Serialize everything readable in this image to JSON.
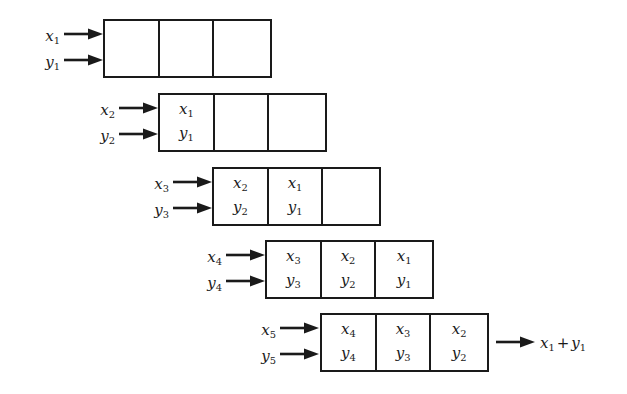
{
  "diagram": {
    "stroke_color": "#1a1a1a",
    "background_color": "#ffffff",
    "stages": [
      {
        "id": "stage-1",
        "inputs": [
          {
            "label": "x",
            "index": "1"
          },
          {
            "label": "y",
            "index": "1"
          }
        ],
        "cells": [
          {
            "top": "",
            "top_index": "",
            "bottom": "",
            "bottom_index": ""
          },
          {
            "top": "",
            "top_index": "",
            "bottom": "",
            "bottom_index": ""
          },
          {
            "top": "",
            "top_index": "",
            "bottom": "",
            "bottom_index": ""
          }
        ],
        "output": null
      },
      {
        "id": "stage-2",
        "inputs": [
          {
            "label": "x",
            "index": "2"
          },
          {
            "label": "y",
            "index": "2"
          }
        ],
        "cells": [
          {
            "top": "x",
            "top_index": "1",
            "bottom": "y",
            "bottom_index": "1"
          },
          {
            "top": "",
            "top_index": "",
            "bottom": "",
            "bottom_index": ""
          },
          {
            "top": "",
            "top_index": "",
            "bottom": "",
            "bottom_index": ""
          }
        ],
        "output": null
      },
      {
        "id": "stage-3",
        "inputs": [
          {
            "label": "x",
            "index": "3"
          },
          {
            "label": "y",
            "index": "3"
          }
        ],
        "cells": [
          {
            "top": "x",
            "top_index": "2",
            "bottom": "y",
            "bottom_index": "2"
          },
          {
            "top": "x",
            "top_index": "1",
            "bottom": "y",
            "bottom_index": "1"
          },
          {
            "top": "",
            "top_index": "",
            "bottom": "",
            "bottom_index": ""
          }
        ],
        "output": null
      },
      {
        "id": "stage-4",
        "inputs": [
          {
            "label": "x",
            "index": "4"
          },
          {
            "label": "y",
            "index": "4"
          }
        ],
        "cells": [
          {
            "top": "x",
            "top_index": "3",
            "bottom": "y",
            "bottom_index": "3"
          },
          {
            "top": "x",
            "top_index": "2",
            "bottom": "y",
            "bottom_index": "2"
          },
          {
            "top": "x",
            "top_index": "1",
            "bottom": "y",
            "bottom_index": "1"
          }
        ],
        "output": null
      },
      {
        "id": "stage-5",
        "inputs": [
          {
            "label": "x",
            "index": "5"
          },
          {
            "label": "y",
            "index": "5"
          }
        ],
        "cells": [
          {
            "top": "x",
            "top_index": "4",
            "bottom": "y",
            "bottom_index": "4"
          },
          {
            "top": "x",
            "top_index": "3",
            "bottom": "y",
            "bottom_index": "3"
          },
          {
            "top": "x",
            "top_index": "2",
            "bottom": "y",
            "bottom_index": "2"
          }
        ],
        "output": {
          "left": "x",
          "left_index": "1",
          "op": "+",
          "right": "y",
          "right_index": "1"
        }
      }
    ]
  }
}
